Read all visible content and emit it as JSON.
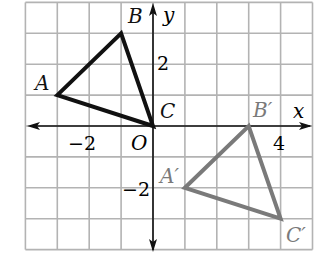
{
  "diagram": {
    "type": "coordinate-plane-translation",
    "grid": {
      "x_min": -4,
      "x_max": 5,
      "y_min": -4,
      "y_max": 4,
      "step": 1,
      "color": "#b3b3b3"
    },
    "axes": {
      "x_label": "x",
      "y_label": "y",
      "origin_label": "O"
    },
    "tick_labels": [
      {
        "axis": "x",
        "value": -2,
        "text": "−2"
      },
      {
        "axis": "x",
        "value": 4,
        "text": "4"
      },
      {
        "axis": "y",
        "value": 2,
        "text": "2"
      },
      {
        "axis": "y",
        "value": -2,
        "text": "−2"
      }
    ],
    "triangles": [
      {
        "name": "ABC",
        "color": "#111111",
        "vertices": [
          {
            "label": "A",
            "x": -3,
            "y": 1
          },
          {
            "label": "B",
            "x": -1,
            "y": 3
          },
          {
            "label": "C",
            "x": 0,
            "y": 0
          }
        ]
      },
      {
        "name": "A'B'C'",
        "color": "#7a7a7a",
        "vertices": [
          {
            "label": "A′",
            "x": 1,
            "y": -2
          },
          {
            "label": "B′",
            "x": 3,
            "y": 0
          },
          {
            "label": "C′",
            "x": 4,
            "y": -3
          }
        ]
      }
    ]
  }
}
